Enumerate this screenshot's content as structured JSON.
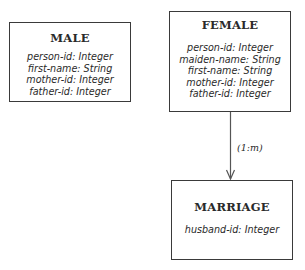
{
  "diagram": {
    "entities": {
      "male": {
        "title": "MALE",
        "attributes": [
          "person-id: Integer",
          "first-name: String",
          "mother-id: Integer",
          "father-id: Integer"
        ]
      },
      "female": {
        "title": "FEMALE",
        "attributes": [
          "person-id: Integer",
          "maiden-name: String",
          "first-name: String",
          "mother-id: Integer",
          "father-id: Integer"
        ]
      },
      "marriage": {
        "title": "MARRIAGE",
        "attributes": [
          "husband-id: Integer"
        ]
      }
    },
    "relationships": [
      {
        "from": "FEMALE",
        "to": "MARRIAGE",
        "label": "(1:m)"
      }
    ]
  }
}
